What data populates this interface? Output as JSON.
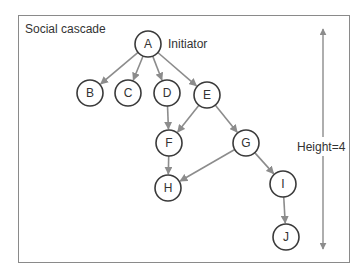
{
  "diagram": {
    "title": "Social cascade",
    "initiator_label": "Initiator",
    "height_label": "Height=4",
    "colors": {
      "frame": "#8a8a8a",
      "edge": "#8c8c8c",
      "node_stroke": "#3a3a3a",
      "text": "#333333"
    },
    "nodes": [
      {
        "id": "A",
        "label": "A",
        "x": 148,
        "y": 44
      },
      {
        "id": "B",
        "label": "B",
        "x": 90,
        "y": 93
      },
      {
        "id": "C",
        "label": "C",
        "x": 128,
        "y": 93
      },
      {
        "id": "D",
        "label": "D",
        "x": 167,
        "y": 93
      },
      {
        "id": "E",
        "label": "E",
        "x": 207,
        "y": 95
      },
      {
        "id": "F",
        "label": "F",
        "x": 169,
        "y": 143
      },
      {
        "id": "G",
        "label": "G",
        "x": 246,
        "y": 143
      },
      {
        "id": "H",
        "label": "H",
        "x": 168,
        "y": 188
      },
      {
        "id": "I",
        "label": "I",
        "x": 283,
        "y": 184
      },
      {
        "id": "J",
        "label": "J",
        "x": 286,
        "y": 237
      }
    ],
    "edges": [
      {
        "from": "A",
        "to": "B"
      },
      {
        "from": "A",
        "to": "C"
      },
      {
        "from": "A",
        "to": "D"
      },
      {
        "from": "A",
        "to": "E"
      },
      {
        "from": "D",
        "to": "F"
      },
      {
        "from": "E",
        "to": "F"
      },
      {
        "from": "E",
        "to": "G"
      },
      {
        "from": "F",
        "to": "H"
      },
      {
        "from": "G",
        "to": "H"
      },
      {
        "from": "G",
        "to": "I"
      },
      {
        "from": "I",
        "to": "J"
      }
    ]
  }
}
